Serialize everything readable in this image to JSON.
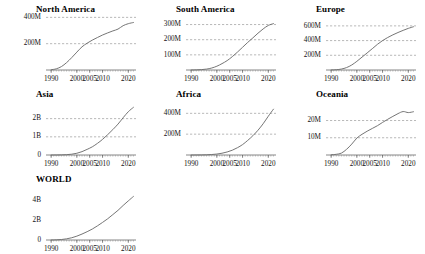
{
  "figure": {
    "background": "#ffffff",
    "line_color": "#6e6e6e",
    "grid_color": "#8a8a8a",
    "axis_color": "#555555",
    "text_color": "#111111"
  },
  "chart_data": [
    {
      "type": "line",
      "title": "North America",
      "xlabel": "",
      "ylabel": "",
      "grid": true,
      "xlim": [
        1988,
        2023
      ],
      "ylim": [
        0,
        380000000
      ],
      "xticks": [
        1990,
        2000,
        2005,
        2010,
        2020
      ],
      "xticklabels": [
        "1990",
        "2000",
        "2005",
        "2010",
        "2020"
      ],
      "yticks": [
        200000000,
        400000000
      ],
      "yticklabels": [
        "200M",
        "400M"
      ],
      "x": [
        1990,
        1992,
        1994,
        1996,
        1998,
        2000,
        2002,
        2004,
        2006,
        2008,
        2010,
        2012,
        2014,
        2016,
        2018,
        2020,
        2022
      ],
      "values": [
        2000000,
        9000000,
        26000000,
        56000000,
        94000000,
        136000000,
        176000000,
        204000000,
        227000000,
        247000000,
        266000000,
        282000000,
        297000000,
        311000000,
        337000000,
        352000000,
        361000000
      ]
    },
    {
      "type": "line",
      "title": "South America",
      "xlabel": "",
      "ylabel": "",
      "grid": true,
      "xlim": [
        1988,
        2023
      ],
      "ylim": [
        0,
        330000000
      ],
      "xticks": [
        1990,
        2000,
        2005,
        2010,
        2020
      ],
      "xticklabels": [
        "1990",
        "2000",
        "2005",
        "2010",
        "2020"
      ],
      "yticks": [
        100000000,
        200000000,
        300000000
      ],
      "yticklabels": [
        "100M",
        "200M",
        "300M"
      ],
      "x": [
        1990,
        1992,
        1994,
        1996,
        1998,
        2000,
        2002,
        2004,
        2006,
        2008,
        2010,
        2012,
        2014,
        2016,
        2018,
        2020,
        2022
      ],
      "values": [
        200000,
        900000,
        2500000,
        6000000,
        13000000,
        25000000,
        42000000,
        62000000,
        88000000,
        118000000,
        150000000,
        182000000,
        212000000,
        243000000,
        271000000,
        294000000,
        306000000
      ]
    },
    {
      "type": "line",
      "title": "Europe",
      "xlabel": "",
      "ylabel": "",
      "grid": true,
      "xlim": [
        1988,
        2023
      ],
      "ylim": [
        0,
        680000000
      ],
      "xticks": [
        1990,
        2000,
        2005,
        2010,
        2020
      ],
      "xticklabels": [
        "1990",
        "2000",
        "2005",
        "2010",
        "2020"
      ],
      "yticks": [
        200000000,
        400000000,
        600000000
      ],
      "yticklabels": [
        "200M",
        "400M",
        "600M"
      ],
      "x": [
        1990,
        1992,
        1994,
        1996,
        1998,
        2000,
        2002,
        2004,
        2006,
        2008,
        2010,
        2012,
        2014,
        2016,
        2018,
        2020,
        2022
      ],
      "values": [
        1000000,
        4000000,
        13000000,
        33000000,
        68000000,
        118000000,
        175000000,
        232000000,
        290000000,
        349000000,
        400000000,
        442000000,
        478000000,
        510000000,
        539000000,
        566000000,
        588000000
      ]
    },
    {
      "type": "line",
      "title": "Asia",
      "xlabel": "",
      "ylabel": "",
      "grid": true,
      "xlim": [
        1988,
        2023
      ],
      "ylim": [
        0,
        2750000000
      ],
      "xticks": [
        1990,
        2000,
        2005,
        2010,
        2020
      ],
      "xticklabels": [
        "1990",
        "2000",
        "2005",
        "2010",
        "2020"
      ],
      "yticks": [
        0,
        1000000000,
        2000000000
      ],
      "yticklabels": [
        "0",
        "1B",
        "2B"
      ],
      "x": [
        1990,
        1992,
        1994,
        1996,
        1998,
        2000,
        2002,
        2004,
        2006,
        2008,
        2010,
        2012,
        2014,
        2016,
        2018,
        2020,
        2022
      ],
      "values": [
        300000,
        1500000,
        6000000,
        18000000,
        44000000,
        96000000,
        185000000,
        310000000,
        450000000,
        640000000,
        860000000,
        1120000000,
        1400000000,
        1700000000,
        2050000000,
        2380000000,
        2620000000
      ]
    },
    {
      "type": "line",
      "title": "Africa",
      "xlabel": "",
      "ylabel": "",
      "grid": true,
      "xlim": [
        1988,
        2023
      ],
      "ylim": [
        0,
        480000000
      ],
      "xticks": [
        1990,
        2000,
        2005,
        2010,
        2020
      ],
      "xticklabels": [
        "1990",
        "2000",
        "2005",
        "2010",
        "2020"
      ],
      "yticks": [
        200000000,
        400000000
      ],
      "yticklabels": [
        "200M",
        "400M"
      ],
      "x": [
        1990,
        1992,
        1994,
        1996,
        1998,
        2000,
        2002,
        2004,
        2006,
        2008,
        2010,
        2012,
        2014,
        2016,
        2018,
        2020,
        2022
      ],
      "values": [
        50000,
        200000,
        700000,
        2000000,
        4500000,
        9000000,
        17000000,
        29000000,
        46000000,
        70000000,
        100000000,
        140000000,
        185000000,
        238000000,
        300000000,
        372000000,
        440000000
      ]
    },
    {
      "type": "line",
      "title": "Oceania",
      "xlabel": "",
      "ylabel": "",
      "grid": true,
      "xlim": [
        1988,
        2023
      ],
      "ylim": [
        0,
        29000000
      ],
      "xticks": [
        1990,
        2000,
        2005,
        2010,
        2020
      ],
      "xticklabels": [
        "1990",
        "2000",
        "2005",
        "2010",
        "2020"
      ],
      "yticks": [
        10000000,
        20000000
      ],
      "yticklabels": [
        "10M",
        "20M"
      ],
      "x": [
        1990,
        1992,
        1994,
        1996,
        1998,
        2000,
        2002,
        2004,
        2006,
        2008,
        2010,
        2012,
        2014,
        2016,
        2018,
        2020,
        2022
      ],
      "values": [
        150000,
        400000,
        1100000,
        3300000,
        6300000,
        9800000,
        12000000,
        13800000,
        15400000,
        17000000,
        18900000,
        20700000,
        22400000,
        24000000,
        25200000,
        24600000,
        25100000
      ]
    },
    {
      "type": "line",
      "title": "WORLD",
      "xlabel": "",
      "ylabel": "",
      "grid": false,
      "xlim": [
        1988,
        2023
      ],
      "ylim": [
        0,
        5100000000
      ],
      "xticks": [
        1990,
        2000,
        2005,
        2010,
        2020
      ],
      "xticklabels": [
        "1990",
        "2000",
        "2005",
        "2010",
        "2020"
      ],
      "yticks": [
        0,
        2000000000,
        4000000000
      ],
      "yticklabels": [
        "0",
        "2B",
        "4B"
      ],
      "x": [
        1990,
        1992,
        1994,
        1996,
        1998,
        2000,
        2002,
        2004,
        2006,
        2008,
        2010,
        2012,
        2014,
        2016,
        2018,
        2020,
        2022
      ],
      "values": [
        3700000,
        16000000,
        49000000,
        118000000,
        230000000,
        394000000,
        607000000,
        847000000,
        1116000000,
        1441000000,
        1795000000,
        2168000000,
        2594000000,
        3026000000,
        3522000000,
        3988000000,
        4440000000
      ]
    }
  ],
  "layout": {
    "columns": 3,
    "rows": 3,
    "panel_positions": [
      {
        "left": 14,
        "top": 4,
        "width": 126,
        "height": 80
      },
      {
        "left": 154,
        "top": 4,
        "width": 126,
        "height": 80
      },
      {
        "left": 294,
        "top": 4,
        "width": 126,
        "height": 80
      },
      {
        "left": 14,
        "top": 89,
        "width": 126,
        "height": 80
      },
      {
        "left": 154,
        "top": 89,
        "width": 126,
        "height": 80
      },
      {
        "left": 294,
        "top": 89,
        "width": 126,
        "height": 80
      },
      {
        "left": 14,
        "top": 174,
        "width": 126,
        "height": 80
      }
    ]
  }
}
